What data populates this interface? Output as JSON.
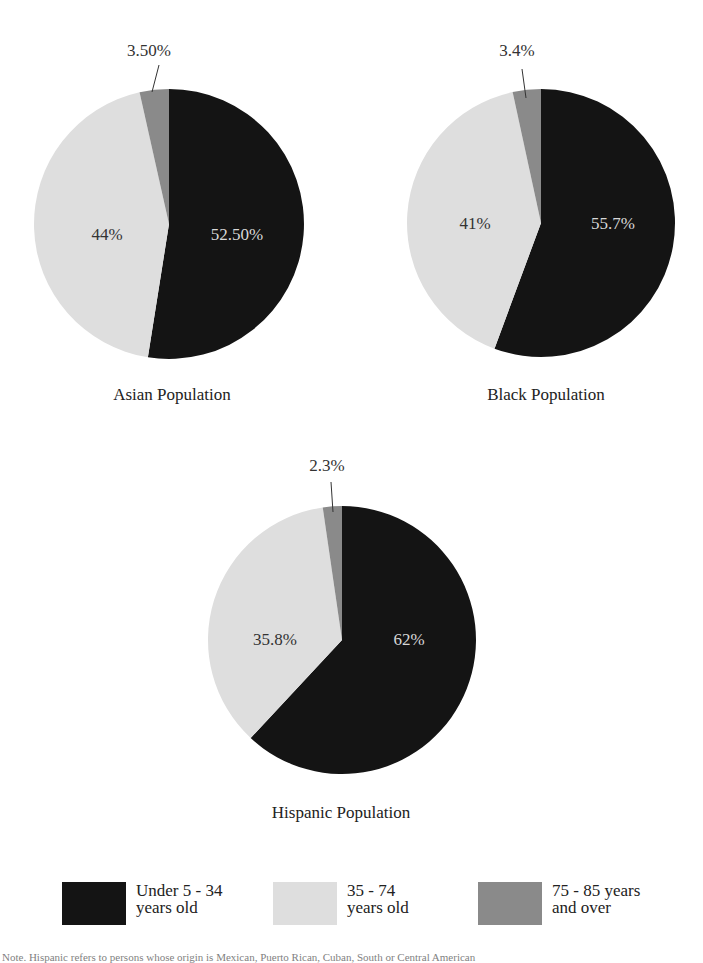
{
  "colors": {
    "under_34": "#141414",
    "age_35_74": "#dedede",
    "age_75_85": "#8a8a8a",
    "background": "#ffffff"
  },
  "legend": [
    {
      "line1": "Under 5 - 34",
      "line2": "years old",
      "color": "#141414"
    },
    {
      "line1": "35 - 74",
      "line2": "years old",
      "color": "#dedede"
    },
    {
      "line1": "75 - 85 years",
      "line2": "and over",
      "color": "#8a8a8a"
    }
  ],
  "pies": [
    {
      "title": "Asian Population",
      "labels": {
        "under_34": "52.50%",
        "age_35_74": "44%",
        "age_75_85": "3.50%"
      }
    },
    {
      "title": "Black Population",
      "labels": {
        "under_34": "55.7%",
        "age_35_74": "41%",
        "age_75_85": "3.4%"
      }
    },
    {
      "title": "Hispanic Population",
      "labels": {
        "under_34": "62%",
        "age_35_74": "35.8%",
        "age_75_85": "2.3%"
      }
    }
  ],
  "note": "Note. Hispanic refers to persons whose origin is Mexican, Puerto Rican, Cuban, South or Central American",
  "chart_data": [
    {
      "type": "pie",
      "title": "Asian Population",
      "categories": [
        "Under 5 - 34 years old",
        "35 - 74 years old",
        "75 - 85 years and over"
      ],
      "values": [
        52.5,
        44,
        3.5
      ],
      "data_labels": [
        "52.50%",
        "44%",
        "3.50%"
      ],
      "legend_position": "bottom"
    },
    {
      "type": "pie",
      "title": "Black Population",
      "categories": [
        "Under 5 - 34 years old",
        "35 - 74 years old",
        "75 - 85 years and over"
      ],
      "values": [
        55.7,
        41,
        3.4
      ],
      "data_labels": [
        "55.7%",
        "41%",
        "3.4%"
      ],
      "legend_position": "bottom"
    },
    {
      "type": "pie",
      "title": "Hispanic Population",
      "categories": [
        "Under 5 - 34 years old",
        "35 - 74 years old",
        "75 - 85 years and over"
      ],
      "values": [
        62,
        35.8,
        2.3
      ],
      "data_labels": [
        "62%",
        "35.8%",
        "2.3%"
      ],
      "legend_position": "bottom"
    }
  ]
}
